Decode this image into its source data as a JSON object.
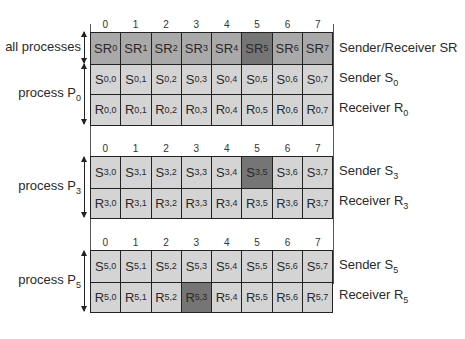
{
  "column_indices": [
    "0",
    "1",
    "2",
    "3",
    "4",
    "5",
    "6",
    "7"
  ],
  "colors": {
    "light": "#d4d4d4",
    "mid": "#a9a9a9",
    "dark": "#757575",
    "border": "#222222"
  },
  "blocks": [
    {
      "rows": [
        {
          "group": "all processes",
          "legend": {
            "text": "Sender/Receiver SR",
            "sub": ""
          },
          "cells": [
            {
              "base": "SR",
              "sub": "0",
              "shade": "mid"
            },
            {
              "base": "SR",
              "sub": "1",
              "shade": "mid"
            },
            {
              "base": "SR",
              "sub": "2",
              "shade": "mid"
            },
            {
              "base": "SR",
              "sub": "3",
              "shade": "mid"
            },
            {
              "base": "SR",
              "sub": "4",
              "shade": "mid"
            },
            {
              "base": "SR",
              "sub": "5",
              "shade": "dark"
            },
            {
              "base": "SR",
              "sub": "6",
              "shade": "mid"
            },
            {
              "base": "SR",
              "sub": "7",
              "shade": "mid"
            }
          ]
        },
        {
          "legend": {
            "text": "Sender S",
            "sub": "0"
          },
          "cells": [
            {
              "base": "S",
              "sub": "0,0",
              "shade": "light"
            },
            {
              "base": "S",
              "sub": "0,1",
              "shade": "light"
            },
            {
              "base": "S",
              "sub": "0,2",
              "shade": "light"
            },
            {
              "base": "S",
              "sub": "0,3",
              "shade": "light"
            },
            {
              "base": "S",
              "sub": "0,4",
              "shade": "light"
            },
            {
              "base": "S",
              "sub": "0,5",
              "shade": "light"
            },
            {
              "base": "S",
              "sub": "0,6",
              "shade": "light"
            },
            {
              "base": "S",
              "sub": "0,7",
              "shade": "light"
            }
          ]
        },
        {
          "legend": {
            "text": "Receiver R",
            "sub": "0"
          },
          "cells": [
            {
              "base": "R",
              "sub": "0,0",
              "shade": "light"
            },
            {
              "base": "R",
              "sub": "0,1",
              "shade": "light"
            },
            {
              "base": "R",
              "sub": "0,2",
              "shade": "light"
            },
            {
              "base": "R",
              "sub": "0,3",
              "shade": "light"
            },
            {
              "base": "R",
              "sub": "0,4",
              "shade": "light"
            },
            {
              "base": "R",
              "sub": "0,5",
              "shade": "light"
            },
            {
              "base": "R",
              "sub": "0,6",
              "shade": "light"
            },
            {
              "base": "R",
              "sub": "0,7",
              "shade": "light"
            }
          ]
        }
      ],
      "group_labels": [
        {
          "text": "all processes",
          "sub": ""
        },
        {
          "text": "process P",
          "sub": "0"
        }
      ]
    },
    {
      "rows": [
        {
          "legend": {
            "text": "Sender S",
            "sub": "3"
          },
          "cells": [
            {
              "base": "S",
              "sub": "3,0",
              "shade": "light"
            },
            {
              "base": "S",
              "sub": "3,1",
              "shade": "light"
            },
            {
              "base": "S",
              "sub": "3,2",
              "shade": "light"
            },
            {
              "base": "S",
              "sub": "3,3",
              "shade": "light"
            },
            {
              "base": "S",
              "sub": "3,4",
              "shade": "light"
            },
            {
              "base": "S",
              "sub": "3,5",
              "shade": "dark"
            },
            {
              "base": "S",
              "sub": "3,6",
              "shade": "light"
            },
            {
              "base": "S",
              "sub": "3,7",
              "shade": "light"
            }
          ]
        },
        {
          "legend": {
            "text": "Receiver R",
            "sub": "3"
          },
          "cells": [
            {
              "base": "R",
              "sub": "3,0",
              "shade": "light"
            },
            {
              "base": "R",
              "sub": "3,1",
              "shade": "light"
            },
            {
              "base": "R",
              "sub": "3,2",
              "shade": "light"
            },
            {
              "base": "R",
              "sub": "3,3",
              "shade": "light"
            },
            {
              "base": "R",
              "sub": "3,4",
              "shade": "light"
            },
            {
              "base": "R",
              "sub": "3,5",
              "shade": "light"
            },
            {
              "base": "R",
              "sub": "3,6",
              "shade": "light"
            },
            {
              "base": "R",
              "sub": "3,7",
              "shade": "light"
            }
          ]
        }
      ],
      "group_labels": [
        {
          "text": "process P",
          "sub": "3"
        }
      ]
    },
    {
      "rows": [
        {
          "legend": {
            "text": "Sender S",
            "sub": "5"
          },
          "cells": [
            {
              "base": "S",
              "sub": "5,0",
              "shade": "light"
            },
            {
              "base": "S",
              "sub": "5,1",
              "shade": "light"
            },
            {
              "base": "S",
              "sub": "5,2",
              "shade": "light"
            },
            {
              "base": "S",
              "sub": "5,3",
              "shade": "light"
            },
            {
              "base": "S",
              "sub": "5,4",
              "shade": "light"
            },
            {
              "base": "S",
              "sub": "5,5",
              "shade": "light"
            },
            {
              "base": "S",
              "sub": "5,6",
              "shade": "light"
            },
            {
              "base": "S",
              "sub": "5,7",
              "shade": "light"
            }
          ]
        },
        {
          "legend": {
            "text": "Receiver R",
            "sub": "5"
          },
          "cells": [
            {
              "base": "R",
              "sub": "5,0",
              "shade": "light"
            },
            {
              "base": "R",
              "sub": "5,1",
              "shade": "light"
            },
            {
              "base": "R",
              "sub": "5,2",
              "shade": "light"
            },
            {
              "base": "R",
              "sub": "5,3",
              "shade": "dark"
            },
            {
              "base": "R",
              "sub": "5,4",
              "shade": "light"
            },
            {
              "base": "R",
              "sub": "5,5",
              "shade": "light"
            },
            {
              "base": "R",
              "sub": "5,6",
              "shade": "light"
            },
            {
              "base": "R",
              "sub": "5,7",
              "shade": "light"
            }
          ]
        }
      ],
      "group_labels": [
        {
          "text": "process P",
          "sub": "5"
        }
      ]
    }
  ]
}
